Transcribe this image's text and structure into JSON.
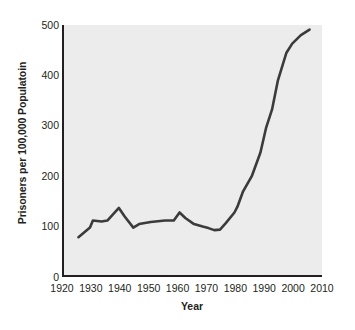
{
  "chart_data": {
    "type": "line",
    "title": "",
    "xlabel": "Year",
    "ylabel": "Prisoners per 100,000 Populatoin",
    "xlim": [
      1920,
      2010
    ],
    "ylim": [
      0,
      500
    ],
    "xticks": [
      "1920",
      "1930",
      "1940",
      "1950",
      "1960",
      "1970",
      "1980",
      "1990",
      "2000",
      "2010"
    ],
    "yticks": [
      "0",
      "100",
      "200",
      "300",
      "400",
      "500"
    ],
    "grid": false,
    "legend": false,
    "line_color": "#3b3b3b",
    "plot_background": "#ececec",
    "series": [
      {
        "name": "Incarceration rate",
        "x": [
          1925,
          1929,
          1930,
          1933,
          1935,
          1939,
          1941,
          1944,
          1946,
          1950,
          1955,
          1958,
          1960,
          1962,
          1965,
          1968,
          1970,
          1972,
          1974,
          1976,
          1979,
          1980,
          1982,
          1985,
          1988,
          1990,
          1992,
          1994,
          1997,
          1999,
          2002,
          2005
        ],
        "y": [
          79,
          98,
          112,
          110,
          112,
          137,
          120,
          98,
          105,
          109,
          112,
          112,
          128,
          117,
          105,
          100,
          97,
          93,
          94,
          107,
          128,
          139,
          170,
          200,
          247,
          297,
          332,
          389,
          445,
          463,
          480,
          491
        ]
      }
    ]
  }
}
